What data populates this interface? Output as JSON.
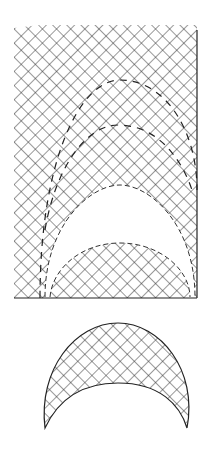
{
  "figure": {
    "colors": {
      "line": "#222222",
      "background": "#ffffff"
    },
    "rect": {
      "x": 14,
      "y": 25,
      "w": 183,
      "h": 273
    },
    "cutout_crescent": {
      "outer_top_y": 185,
      "inner_top_y": 243,
      "left_x": 45,
      "right_x": 195,
      "base_y": 297
    },
    "outer_dashed_arc": {
      "top_y": 80,
      "left_x": 40,
      "right_x": 197
    },
    "inner_dashed_arc": {
      "top_y": 125,
      "left_x": 45,
      "right_x": 195
    },
    "separate_crescent": {
      "outer_top_y": 323,
      "inner_top_y": 383,
      "left_x": 42,
      "right_x": 193,
      "base_y": 428
    }
  }
}
